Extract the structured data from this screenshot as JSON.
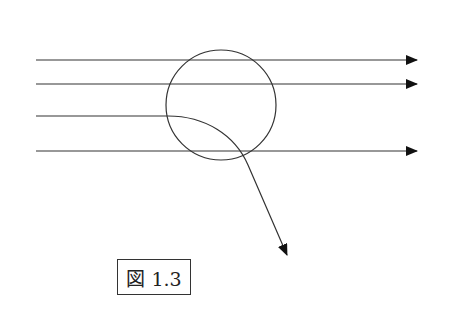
{
  "figure": {
    "caption": "図 1.3",
    "line_color": "#333333",
    "circle": {
      "cx": 221,
      "cy": 105,
      "r": 55
    },
    "straight_rays": [
      {
        "y": 60,
        "x1": 36,
        "x2": 417
      },
      {
        "y": 84,
        "x1": 36,
        "x2": 417
      },
      {
        "y": 151,
        "x1": 36,
        "x2": 417
      }
    ],
    "deflected_ray": {
      "start": [
        36,
        116
      ],
      "enter": [
        168,
        116
      ],
      "tip": [
        287,
        255
      ]
    }
  }
}
